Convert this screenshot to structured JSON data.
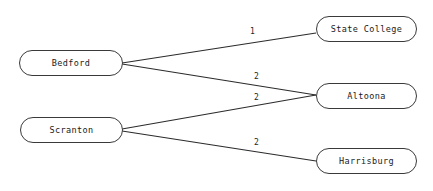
{
  "diagram": {
    "type": "node-link-diagram",
    "background_color": "#ffffff",
    "node_border_color": "#3a3a3a",
    "node_fill_color": "#ffffff",
    "edge_color": "#2b2b2b",
    "text_color": "#1a1a1a"
  },
  "nodes": [
    {
      "id": "bedford",
      "label": "Bedford",
      "x": 19,
      "y": 50,
      "width": 104,
      "height": 26,
      "column": "left"
    },
    {
      "id": "scranton",
      "label": "Scranton",
      "x": 20,
      "y": 117,
      "width": 103,
      "height": 26,
      "column": "left"
    },
    {
      "id": "state-college",
      "label": "State College",
      "x": 316,
      "y": 16,
      "width": 101,
      "height": 26,
      "column": "right"
    },
    {
      "id": "altoona",
      "label": "Altoona",
      "x": 316,
      "y": 83,
      "width": 101,
      "height": 26,
      "column": "right"
    },
    {
      "id": "harrisburg",
      "label": "Harrisburg",
      "x": 316,
      "y": 148,
      "width": 101,
      "height": 26,
      "column": "right"
    }
  ],
  "edges": [
    {
      "id": "bedford-state-college",
      "from": "bedford",
      "to": "state-college",
      "label": "1",
      "x1": 122,
      "y1": 63,
      "x2": 316,
      "y2": 33,
      "label_x": 250,
      "label_y": 28
    },
    {
      "id": "bedford-altoona",
      "from": "bedford",
      "to": "altoona",
      "label": "2",
      "x1": 122,
      "y1": 64,
      "x2": 316,
      "y2": 95,
      "label_x": 254,
      "label_y": 73
    },
    {
      "id": "scranton-altoona",
      "from": "scranton",
      "to": "altoona",
      "label": "2",
      "x1": 122,
      "y1": 129,
      "x2": 316,
      "y2": 95,
      "label_x": 254,
      "label_y": 94
    },
    {
      "id": "scranton-harrisburg",
      "from": "scranton",
      "to": "harrisburg",
      "label": "2",
      "x1": 122,
      "y1": 131,
      "x2": 316,
      "y2": 161,
      "label_x": 254,
      "label_y": 139
    }
  ]
}
